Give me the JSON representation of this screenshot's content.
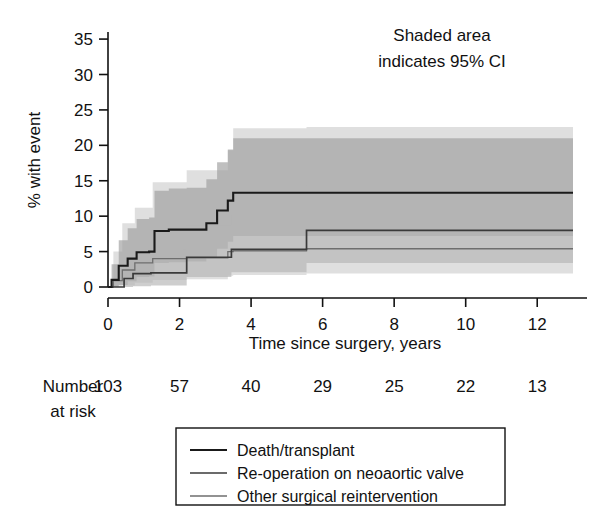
{
  "figure": {
    "annotation_line1": "Shaded area",
    "annotation_line2": "indicates 95% CI",
    "ylabel": "% with event",
    "xlabel": "Time since surgery, years"
  },
  "risk_table": {
    "label_line1": "Number",
    "label_line2": "at risk",
    "values": [
      "103",
      "57",
      "40",
      "29",
      "25",
      "22",
      "13"
    ],
    "at_times": [
      0,
      2,
      4,
      6,
      8,
      10,
      12
    ]
  },
  "legend": {
    "items": [
      {
        "label": "Death/transplant",
        "color": "#1a1a1a",
        "width": 2.1
      },
      {
        "label": "Re-operation on neoaortic valve",
        "color": "#3a3a3a",
        "width": 1.7
      },
      {
        "label": "Other surgical reintervention",
        "color": "#6e6e6e",
        "width": 1.3
      }
    ]
  },
  "chart_data": {
    "type": "line",
    "title": "",
    "xlabel": "Time since surgery, years",
    "ylabel": "% with event",
    "xlim": [
      0,
      13
    ],
    "ylim": [
      0,
      36
    ],
    "xticks": [
      0,
      2,
      4,
      6,
      8,
      10,
      12
    ],
    "yticks": [
      0,
      5,
      10,
      15,
      20,
      25,
      30,
      35
    ],
    "grid": false,
    "legend_position": "below-axes",
    "annotations": [
      "Shaded area",
      "indicates 95% CI"
    ],
    "shaded_meaning": "95% CI",
    "step_style": "post",
    "series": [
      {
        "name": "Death/transplant",
        "color": "#1a1a1a",
        "band_color": "#9e9e9e",
        "x": [
          0.0,
          0.1,
          0.3,
          0.55,
          0.8,
          1.15,
          1.3,
          1.7,
          2.2,
          2.75,
          3.05,
          3.35,
          3.5,
          13.0
        ],
        "y": [
          0.0,
          1.0,
          3.0,
          4.0,
          4.9,
          5.0,
          7.9,
          8.1,
          8.1,
          9.0,
          10.8,
          12.2,
          13.3,
          13.3
        ],
        "ci_lower": [
          0.0,
          0.0,
          0.3,
          0.8,
          1.4,
          1.5,
          3.4,
          3.5,
          3.6,
          4.2,
          5.4,
          6.4,
          7.2,
          7.2
        ],
        "ci_upper": [
          0.0,
          3.2,
          6.6,
          8.3,
          9.6,
          9.8,
          13.6,
          13.9,
          14.0,
          15.2,
          17.6,
          19.4,
          21.0,
          21.0
        ]
      },
      {
        "name": "Re-operation on neoaortic valve",
        "color": "#3a3a3a",
        "band_color": "#b5b5b5",
        "x": [
          0.0,
          0.45,
          0.7,
          1.2,
          2.1,
          2.2,
          3.45,
          5.55,
          13.0
        ],
        "y": [
          0.0,
          1.2,
          1.9,
          2.0,
          2.0,
          4.2,
          5.3,
          8.0,
          8.0
        ],
        "ci_lower": [
          0.0,
          0.0,
          0.1,
          0.2,
          0.2,
          1.4,
          2.1,
          3.4,
          3.4
        ],
        "ci_upper": [
          0.0,
          3.9,
          5.0,
          5.2,
          5.3,
          8.7,
          10.2,
          14.3,
          14.3
        ]
      },
      {
        "name": "Other surgical reintervention",
        "color": "#6e6e6e",
        "band_color": "#d8d8d8",
        "x": [
          0.0,
          0.15,
          0.4,
          0.75,
          1.25,
          2.2,
          3.35,
          3.5,
          5.55,
          13.0
        ],
        "y": [
          0.0,
          0.9,
          2.4,
          3.4,
          4.0,
          4.1,
          5.0,
          5.1,
          5.4,
          5.4
        ],
        "ci_lower": [
          0.0,
          0.0,
          0.2,
          0.6,
          1.0,
          1.1,
          1.6,
          1.7,
          1.9,
          1.9
        ],
        "ci_upper": [
          0.0,
          5.0,
          9.0,
          11.2,
          14.8,
          16.5,
          19.3,
          22.4,
          22.6,
          22.6
        ]
      }
    ]
  }
}
